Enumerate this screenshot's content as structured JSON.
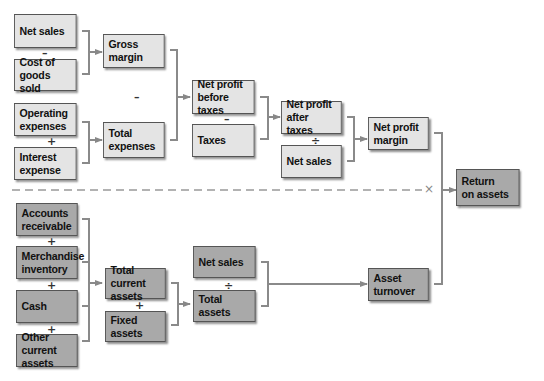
{
  "diagram": {
    "colors": {
      "light_box": "#e4e4e4",
      "dark_box": "#a9a9a9",
      "connector": "#888888",
      "border": "#555555"
    },
    "top_section": {
      "net_sales": "Net sales",
      "op_minus_1": "–",
      "cost_of_goods_sold": "Cost of\ngoods sold",
      "operating_expenses": "Operating\nexpenses",
      "op_plus_1": "+",
      "interest_expense": "Interest\nexpense",
      "gross_margin": "Gross\nmargin",
      "op_minus_2": "–",
      "total_expenses": "Total\nexpenses",
      "net_profit_before_taxes": "Net profit\nbefore taxes",
      "op_minus_3": "–",
      "taxes": "Taxes",
      "net_profit_after_taxes": "Net profit\nafter taxes",
      "op_divide_1": "÷",
      "net_sales_2": "Net sales",
      "net_profit_margin": "Net profit\nmargin"
    },
    "divider": {
      "style": "dashed",
      "marker": "×"
    },
    "result": {
      "return_on_assets": "Return\non assets"
    },
    "bottom_section": {
      "accounts_receivable": "Accounts\nreceivable",
      "op_plus_2": "+",
      "merchandise_inventory": "Merchandise\ninventory",
      "op_plus_3": "+",
      "cash": "Cash",
      "op_plus_4": "+",
      "other_current_assets": "Other current\nassets",
      "total_current_assets": "Total current\nassets",
      "op_plus_5": "+",
      "fixed_assets": "Fixed assets",
      "net_sales_3": "Net sales",
      "op_divide_2": "÷",
      "total_assets": "Total assets",
      "asset_turnover": "Asset\nturnover"
    }
  }
}
